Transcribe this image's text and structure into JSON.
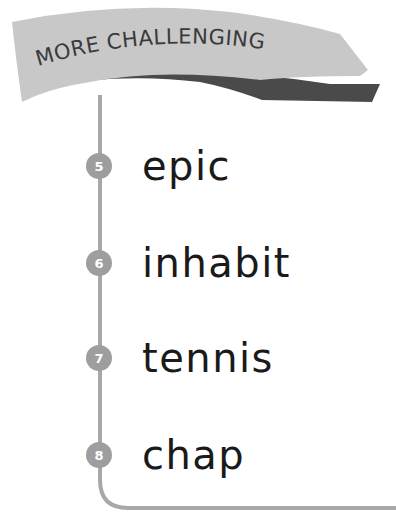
{
  "banner": {
    "label": "MORE CHALLENGING",
    "fill_color": "#c8c8c8",
    "shadow_color": "#4a4a4a"
  },
  "timeline": {
    "line_color": "#a8a8a8"
  },
  "items": [
    {
      "number": "5",
      "word": "epic"
    },
    {
      "number": "6",
      "word": "inhabit"
    },
    {
      "number": "7",
      "word": "tennis"
    },
    {
      "number": "8",
      "word": "chap"
    }
  ]
}
